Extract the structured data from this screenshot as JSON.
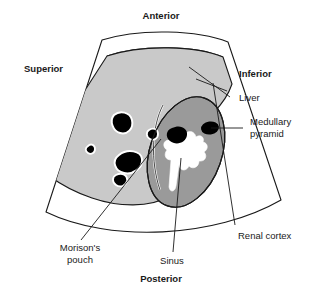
{
  "figure": {
    "kind": "ultrasound-sector-scan-diagram",
    "region": "right upper quadrant",
    "colors": {
      "background": "#ffffff",
      "outline": "#1a1a1a",
      "liver_fill": "#c9c9c9",
      "kidney_fill": "#9a9a9a",
      "vessel_fill": "#000000",
      "vessel_halo": "#ffffff",
      "sinus_fill": "#ffffff",
      "text": "#1a1a1a"
    }
  },
  "orientation_labels": {
    "anterior": "Anterior",
    "superior": "Superior",
    "inferior": "Inferior",
    "posterior": "Posterior"
  },
  "part_labels": {
    "liver": "Liver",
    "medullary_pyramid_line1": "Medullary",
    "medullary_pyramid_line2": "pyramid",
    "renal_cortex": "Renal cortex",
    "sinus": "Sinus",
    "morisons_pouch_line1": "Morison's",
    "morisons_pouch_line2": "pouch"
  }
}
